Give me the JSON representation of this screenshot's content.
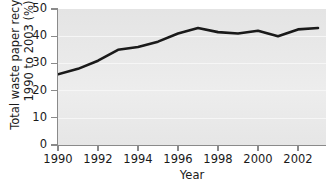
{
  "chart_data": {
    "type": "line",
    "title": "",
    "xlabel": "Year",
    "ylabel": "Total waste paper recycled, 1990 to 2003 (%)",
    "ylabel_lines": [
      "Total waste paper recycled,",
      "1990 to 2003 (%)"
    ],
    "x": [
      1990,
      1991,
      1992,
      1993,
      1994,
      1995,
      1996,
      1997,
      1998,
      1999,
      2000,
      2001,
      2002,
      2003
    ],
    "values": [
      26,
      28,
      31,
      35,
      36,
      38,
      41,
      43,
      41.5,
      41,
      42,
      40,
      42.5,
      43
    ],
    "xlim": [
      1990,
      2003.4
    ],
    "ylim": [
      0,
      50
    ],
    "yticks": [
      0,
      10,
      20,
      30,
      40,
      50
    ],
    "ytick_labels": [
      "0",
      "10",
      "20",
      "30",
      "40",
      "50"
    ],
    "xticks": [
      1990,
      1992,
      1994,
      1996,
      1998,
      2000,
      2002
    ],
    "xtick_labels": [
      "1990",
      "1992",
      "1994",
      "1996",
      "1998",
      "2000",
      "2002"
    ],
    "grid": true,
    "grid_color": "#f6f6f6",
    "legend": false,
    "legend_position": "none",
    "series": [
      {
        "name": "Total waste paper recycled",
        "color": "#1a1a1a",
        "line_width": 2.6,
        "values": [
          26,
          28,
          31,
          35,
          36,
          38,
          41,
          43,
          41.5,
          41,
          42,
          40,
          42.5,
          43
        ]
      }
    ],
    "plot_background": "#e9e9e9",
    "axis_color": "#8a8a8a",
    "figure_background": "#ffffff"
  }
}
